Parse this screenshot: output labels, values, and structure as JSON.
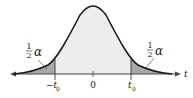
{
  "diagram": {
    "type": "t-distribution two-tailed",
    "axis_label": "t",
    "tick_labels": {
      "left": "−t",
      "left_sub": "0",
      "center": "0",
      "right": "t",
      "right_sub": "0"
    },
    "tail_labels": {
      "left": {
        "num": "1",
        "den": "2",
        "symbol": "α"
      },
      "right": {
        "num": "1",
        "den": "2",
        "symbol": "α"
      }
    },
    "colors": {
      "curve": "#1a1a1a",
      "center_fill": "#ededed",
      "tail_fill": "#a8a8a8",
      "axis": "#444444"
    }
  }
}
